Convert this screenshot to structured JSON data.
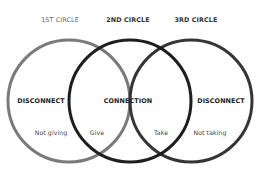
{
  "headers": [
    "1ST CIRCLE",
    "2ND CIRCLE",
    "3RD CIRCLE"
  ],
  "regions": {
    "left": "DISCONNECT",
    "center": "CONNECTION",
    "right": "DISCONNECT"
  },
  "sublabels": {
    "not_giving": "Not giving",
    "give": "Give",
    "take": "Take",
    "not_taking": "Not taking"
  },
  "colors": {
    "circle1": "#7a7a7a",
    "circle2": "#1e1e1e",
    "circle3": "#353535"
  }
}
